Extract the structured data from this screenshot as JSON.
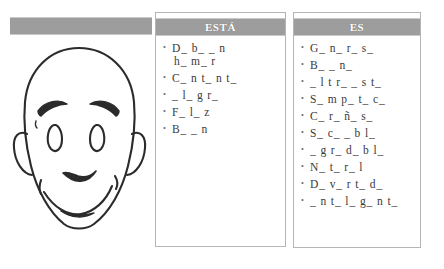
{
  "left_panel": {
    "header_bar_label": "",
    "illustration_name": "smiling-bald-face-line-drawing"
  },
  "columns": [
    {
      "id": "esta",
      "header": "ESTÁ",
      "items": [
        {
          "line1": "D_  b_ _ n",
          "line2": "h_ m_ r"
        },
        {
          "line1": "C_ n t_ n t_",
          "line2": ""
        },
        {
          "line1": "_ l_ g r_",
          "line2": ""
        },
        {
          "line1": "F_ l_ z",
          "line2": ""
        },
        {
          "line1": "B_ _ n",
          "line2": ""
        }
      ]
    },
    {
      "id": "es",
      "header": "ES",
      "items": [
        {
          "line1": "G_ n_ r_ s_",
          "line2": ""
        },
        {
          "line1": "B_ _ n_",
          "line2": ""
        },
        {
          "line1": "_ l t r_ _ s t_",
          "line2": ""
        },
        {
          "line1": "S_ m p_ t_ c_",
          "line2": ""
        },
        {
          "line1": "C_ r_ ñ_ s_",
          "line2": ""
        },
        {
          "line1": "S_ c_ _ b l_",
          "line2": ""
        },
        {
          "line1": "_ g r_ d_ b l_",
          "line2": ""
        },
        {
          "line1": "N_ t_ r_ l",
          "line2": ""
        },
        {
          "line1": "D_ v_ r t_ d_",
          "line2": ""
        },
        {
          "line1": "_ n t_ l_ g_ n t_",
          "line2": ""
        }
      ]
    }
  ],
  "colors": {
    "header_gray": "#9d9d9d",
    "border_gray": "#b5b5b5",
    "text_gray": "#3a3a3a",
    "ink_black": "#2b2b2b",
    "page_white": "#ffffff"
  }
}
